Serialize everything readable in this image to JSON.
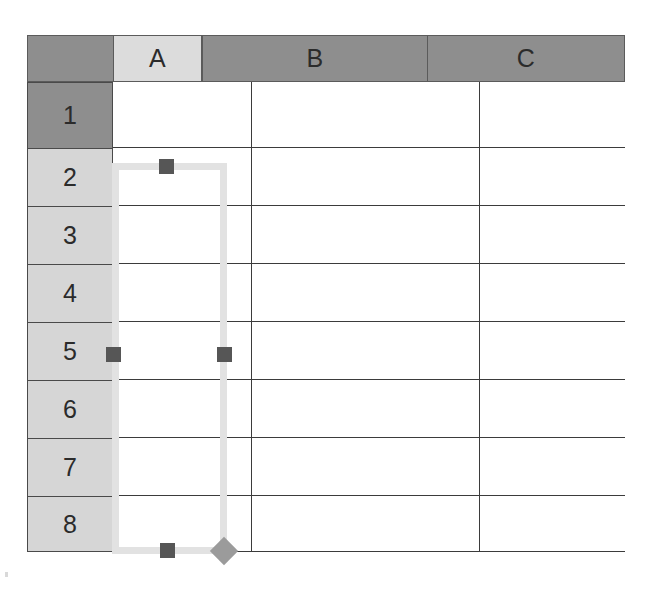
{
  "app": {
    "kind": "spreadsheet-grid",
    "title": "Spreadsheet"
  },
  "grid": {
    "corner_label": "",
    "columns": [
      {
        "label": "A",
        "selected": true
      },
      {
        "label": "B",
        "selected": false
      },
      {
        "label": "C",
        "selected": false
      }
    ],
    "rows": [
      {
        "label": "1",
        "selected": false
      },
      {
        "label": "2",
        "selected": true
      },
      {
        "label": "3",
        "selected": true
      },
      {
        "label": "4",
        "selected": true
      },
      {
        "label": "5",
        "selected": true
      },
      {
        "label": "6",
        "selected": true
      },
      {
        "label": "7",
        "selected": true
      },
      {
        "label": "8",
        "selected": true
      }
    ],
    "cells": []
  },
  "selection": {
    "range": "A2:A8",
    "anchor_column": "A",
    "start_row": "2",
    "end_row": "8",
    "border_color": "#e2e2e2",
    "handle_color": "#565656",
    "fill_handle_color": "#9b9b9b",
    "handles": [
      {
        "name": "top-center",
        "shape": "square"
      },
      {
        "name": "middle-left",
        "shape": "square"
      },
      {
        "name": "middle-right",
        "shape": "square"
      },
      {
        "name": "bottom-center",
        "shape": "square"
      },
      {
        "name": "bottom-right-fill",
        "shape": "diamond"
      }
    ]
  },
  "colors": {
    "header_unselected": "#8e8e8e",
    "header_selected": "#dcdcdc",
    "row_header_selected": "#d6d6d6",
    "gridline": "#3b3b3b",
    "cell_background": "#ffffff",
    "page_background": "#ffffff"
  }
}
